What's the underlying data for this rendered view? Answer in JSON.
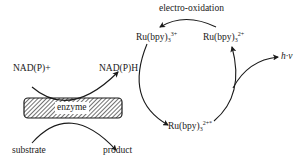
{
  "diagram": {
    "type": "reaction-scheme",
    "enzyme_cycle": {
      "enzyme_label": "enzyme",
      "cofactor_in": "NAD(P)+",
      "cofactor_out": "NAD(P)H",
      "substrate": "substrate",
      "product": "product"
    },
    "ru_cycle": {
      "oxidation_label": "electro-oxidation",
      "ru3_base": "Ru(bpy)",
      "ru3_sub": "3",
      "ru3_sup": "3+",
      "ru2_base": "Ru(bpy)",
      "ru2_sub": "3",
      "ru2_sup": "2+",
      "ru2star_base": "Ru(bpy)",
      "ru2star_sub": "3",
      "ru2star_sup": "2+*",
      "emission_label": "h·ν"
    },
    "colors": {
      "line": "#1a1a1a",
      "hatch": "#333333",
      "background": "#ffffff"
    }
  }
}
